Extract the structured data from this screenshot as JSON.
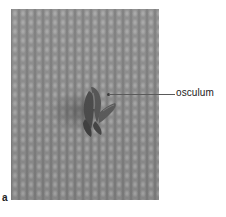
{
  "figure": {
    "panel_letter": "a",
    "photo": {
      "subject": "sponge-specimen",
      "background": "textured-mat",
      "colors": {
        "mat": "#8d8d8d",
        "sponge": "#4a4a4a",
        "sponge_highlight": "#7a7a7a"
      }
    },
    "labels": [
      {
        "text": "osculum",
        "target": "sponge-opening"
      }
    ]
  }
}
